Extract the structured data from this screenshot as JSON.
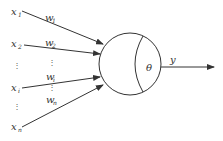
{
  "diagram": {
    "title": "",
    "type": "perceptron-neuron-model",
    "colors": {
      "stroke": "#333333",
      "text": "#333333",
      "background": "#ffffff"
    },
    "inputs": [
      {
        "label": "x",
        "sub": "1",
        "weight_label": "w",
        "weight_sub": "1"
      },
      {
        "label": "x",
        "sub": "2",
        "weight_label": "w",
        "weight_sub": "2"
      },
      {
        "label": "⋮",
        "sub": "",
        "weight_label": "⋮",
        "weight_sub": ""
      },
      {
        "label": "x",
        "sub": "i",
        "weight_label": "w",
        "weight_sub": "i"
      },
      {
        "label": "⋮",
        "sub": "",
        "weight_label": "⋮",
        "weight_sub": ""
      },
      {
        "label": "x",
        "sub": "n",
        "weight_label": "w",
        "weight_sub": "n"
      }
    ],
    "neuron": {
      "threshold_label": "θ"
    },
    "output": {
      "label": "y"
    }
  }
}
